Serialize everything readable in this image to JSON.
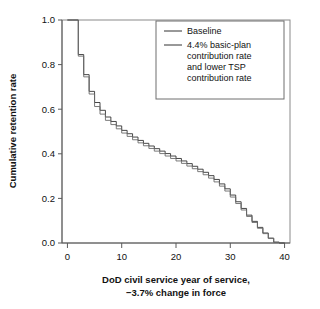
{
  "figure": {
    "background_color": "#ffffff",
    "frame_color": "#8a8a8a",
    "axis_color": "#5a5a5a",
    "text_color": "#111111"
  },
  "chart_data": {
    "type": "line",
    "line_style": "step",
    "title": "",
    "subtitle": "",
    "xlabel_line1": "DoD civil service year of service,",
    "xlabel_line2": "−3.7% change in force",
    "ylabel": "Cumulative retention rate",
    "xlim": [
      -1,
      41
    ],
    "ylim": [
      0.0,
      1.0
    ],
    "xticks": [
      0,
      10,
      20,
      30,
      40
    ],
    "xticklabels": [
      "0",
      "10",
      "20",
      "30",
      "40"
    ],
    "yticks": [
      0.0,
      0.2,
      0.4,
      0.6,
      0.8,
      1.0
    ],
    "yticklabels": [
      "0.0",
      "0.2",
      "0.4",
      "0.6",
      "0.8",
      "1.0"
    ],
    "grid": false,
    "legend_position": "upper right",
    "x": [
      0,
      1,
      2,
      3,
      4,
      5,
      6,
      7,
      8,
      9,
      10,
      11,
      12,
      13,
      14,
      15,
      16,
      17,
      18,
      19,
      20,
      21,
      22,
      23,
      24,
      25,
      26,
      27,
      28,
      29,
      30,
      31,
      32,
      33,
      34,
      35,
      36,
      37,
      38,
      39
    ],
    "series": [
      {
        "name": "Baseline",
        "color": "#333333",
        "line_width": 0.9,
        "values": [
          1.0,
          1.0,
          0.845,
          0.755,
          0.68,
          0.63,
          0.595,
          0.565,
          0.545,
          0.525,
          0.505,
          0.49,
          0.475,
          0.46,
          0.447,
          0.435,
          0.423,
          0.412,
          0.401,
          0.39,
          0.379,
          0.368,
          0.356,
          0.344,
          0.331,
          0.317,
          0.302,
          0.285,
          0.265,
          0.243,
          0.215,
          0.185,
          0.155,
          0.125,
          0.097,
          0.07,
          0.045,
          0.022,
          0.004,
          0.0
        ]
      },
      {
        "name": "4.4% basic-plan contribution rate and lower TSP contribution rate",
        "color": "#6b6b6b",
        "line_width": 0.9,
        "values": [
          1.0,
          1.0,
          0.838,
          0.745,
          0.668,
          0.612,
          0.578,
          0.55,
          0.531,
          0.512,
          0.493,
          0.478,
          0.463,
          0.449,
          0.436,
          0.424,
          0.412,
          0.401,
          0.39,
          0.379,
          0.368,
          0.357,
          0.345,
          0.333,
          0.32,
          0.306,
          0.291,
          0.274,
          0.255,
          0.233,
          0.206,
          0.177,
          0.148,
          0.119,
          0.092,
          0.066,
          0.042,
          0.02,
          0.003,
          0.0
        ]
      }
    ],
    "legend_entries": [
      {
        "label_lines": [
          "Baseline"
        ]
      },
      {
        "label_lines": [
          "4.4% basic-plan",
          "contribution rate",
          "and lower TSP",
          "contribution rate"
        ]
      }
    ]
  }
}
